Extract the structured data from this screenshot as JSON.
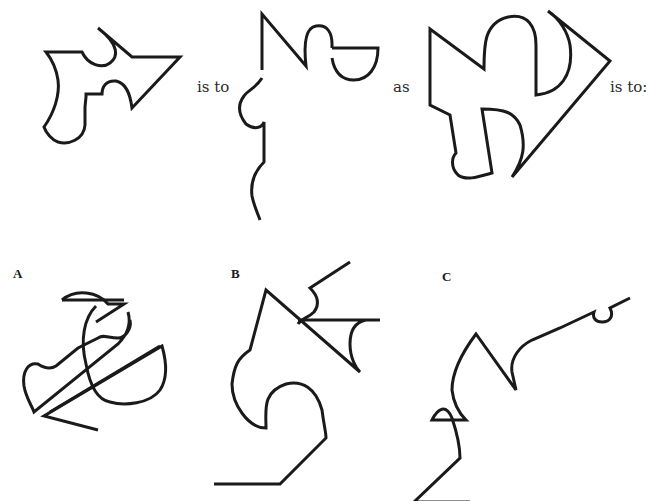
{
  "puzzle": {
    "type": "figural-analogy",
    "connectors": {
      "first": "is to",
      "second": "as",
      "third": "is to:"
    },
    "stem_figures": [
      {
        "id": "figure-1",
        "description": "closed outline shape with arrow-like point and notched edges"
      },
      {
        "id": "figure-2",
        "description": "open outline, partially disassembled version of figure 1"
      },
      {
        "id": "figure-3",
        "description": "closed outline shape with zigzag top and rounded lobes"
      }
    ],
    "options": [
      {
        "label": "A",
        "description": "overlapping tangled lines with curved loops"
      },
      {
        "label": "B",
        "description": "open outline with pointed top and crossing triangle"
      },
      {
        "label": "C",
        "description": "open outline with zigzag and small bump at right end"
      }
    ],
    "colors": {
      "background": "#ffffff",
      "stroke": "#1a1a1a",
      "text": "#2a2a2a"
    }
  }
}
